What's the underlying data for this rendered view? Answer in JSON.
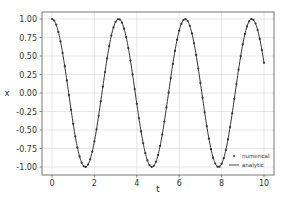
{
  "chart_data": {
    "type": "line",
    "title": "",
    "xlabel": "t",
    "ylabel": "x",
    "xlim": [
      -0.5,
      10.5
    ],
    "ylim": [
      -1.1,
      1.1
    ],
    "xticks": [
      0,
      2,
      4,
      6,
      8,
      10
    ],
    "xtick_labels": [
      "0",
      "2",
      "4",
      "6",
      "8",
      "10"
    ],
    "yticks": [
      1.0,
      0.75,
      0.5,
      0.25,
      0.0,
      -0.25,
      -0.5,
      -0.75,
      -1.0
    ],
    "ytick_labels": [
      "1.00",
      "0.75",
      "0.50",
      "0.25",
      "0.00",
      "-0.25",
      "-0.50",
      "-0.75",
      "-1.00"
    ],
    "grid": true,
    "legend": {
      "placement": "bottom-right",
      "entries": [
        "numerical",
        "analytic"
      ]
    },
    "series": [
      {
        "name": "numerical",
        "style": "markers",
        "function": "cos(2t)",
        "t_start": 0,
        "t_end": 10,
        "t_step": 0.1,
        "color": "#333333"
      },
      {
        "name": "analytic",
        "style": "line",
        "function": "cos(2t)",
        "t_start": 0,
        "t_end": 10,
        "color": "#333333"
      }
    ],
    "end_value": 0.41
  }
}
